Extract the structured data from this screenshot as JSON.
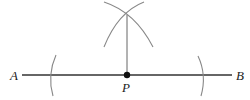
{
  "diagram": {
    "labels": {
      "a": "A",
      "b": "B",
      "p": "P"
    },
    "colors": {
      "line": "#333333",
      "arc": "#888888",
      "point": "#111111"
    },
    "geometry": {
      "segment_ab": {
        "x1": 22,
        "y1": 75,
        "x2": 232,
        "y2": 75
      },
      "point_p": {
        "x": 127,
        "y": 75
      },
      "perpendicular": {
        "x1": 127,
        "y1": 15,
        "x2": 127,
        "y2": 75
      },
      "arc_intersection": {
        "x": 127,
        "y": 15
      }
    }
  }
}
